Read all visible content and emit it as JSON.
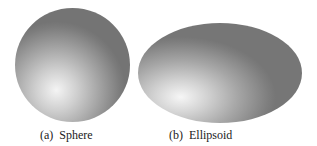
{
  "figures": [
    {
      "label": "(a)",
      "caption": "Sphere",
      "shape": "sphere"
    },
    {
      "label": "(b)",
      "caption": "Ellipsoid",
      "shape": "ellipsoid"
    }
  ],
  "captions": {
    "a": "(a)  Sphere",
    "b": "(b)  Ellipsoid"
  },
  "colors": {
    "highlight": "#f4f4f4",
    "shadow": "#747474",
    "background": "#ffffff"
  }
}
